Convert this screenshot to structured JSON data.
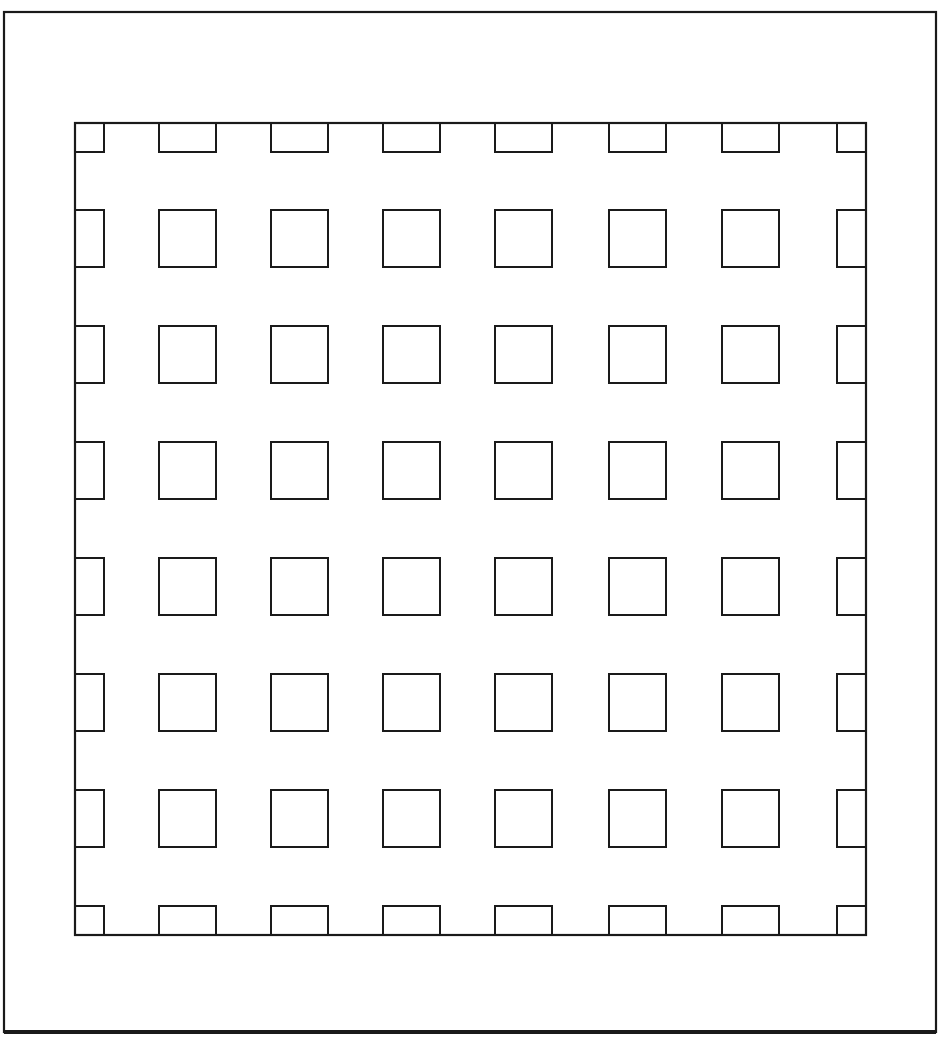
{
  "diagram": {
    "title": "",
    "colors": {
      "stroke": "#1a1a1a",
      "background": "#ffffff"
    },
    "outer_frame": {
      "x": 4,
      "y": 12,
      "w": 932,
      "h": 1020,
      "stroke_width": 2.2,
      "bottom_stroke_width": 4
    },
    "inner_frame": {
      "x": 75,
      "y": 123,
      "w": 791,
      "h": 812,
      "stroke_width": 2.2
    },
    "grid": {
      "columns": 9,
      "rows": 9,
      "col_x": [
        75,
        159,
        271,
        383,
        495,
        609,
        722,
        836
      ],
      "row_y": [
        123,
        210,
        326,
        442,
        558,
        674,
        790,
        907
      ],
      "cell_size": 57,
      "edge_depth": 29,
      "cell_types": {
        "corner": "small square",
        "edge": "half rectangle attached to frame",
        "interior": "full square"
      }
    },
    "counts": {
      "corner_cells": 4,
      "edge_cells": 24,
      "interior_cells": 36
    }
  }
}
